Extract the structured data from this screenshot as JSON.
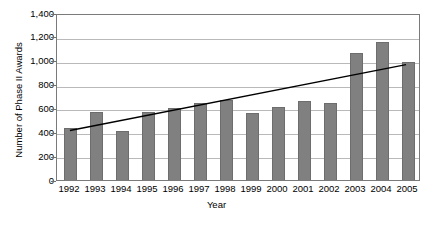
{
  "chart_data": {
    "type": "bar",
    "title": "",
    "xlabel": "Year",
    "ylabel": "Number of Phase II Awards",
    "categories": [
      "1992",
      "1993",
      "1994",
      "1995",
      "1996",
      "1997",
      "1998",
      "1999",
      "2000",
      "2001",
      "2002",
      "2003",
      "2004",
      "2005"
    ],
    "values": [
      430,
      570,
      410,
      570,
      600,
      640,
      665,
      560,
      605,
      660,
      645,
      1060,
      1150,
      985
    ],
    "series": [
      {
        "name": "Number of Phase II Awards",
        "type": "bar",
        "values": [
          430,
          570,
          410,
          570,
          600,
          640,
          665,
          560,
          605,
          660,
          645,
          1060,
          1150,
          985
        ],
        "color": "#808080"
      },
      {
        "name": "Linear trend",
        "type": "line",
        "values": [
          420,
          463,
          506,
          549,
          592,
          635,
          678,
          721,
          764,
          807,
          850,
          893,
          936,
          979
        ],
        "color": "#000000"
      }
    ],
    "ylim": [
      0,
      1400
    ],
    "ytick_values": [
      0,
      200,
      400,
      600,
      800,
      1000,
      1200,
      1400
    ],
    "ytick_labels": [
      "0",
      "200",
      "400",
      "600",
      "800",
      "1,000",
      "1,200",
      "1,400"
    ],
    "grid": true,
    "grid_axis": "y",
    "legend": "none",
    "legend_position": "none",
    "annotations": []
  },
  "colors": {
    "bar_fill": "#808080",
    "bar_edge": "#6d6d6d",
    "gridline": "#b9b9b9",
    "plot_border": "#7a7a7a",
    "trendline": "#000000",
    "background": "#ffffff",
    "text": "#000000"
  }
}
